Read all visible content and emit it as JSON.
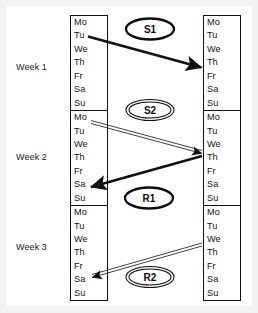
{
  "diagram": {
    "background_color": "#f2f2f2",
    "canvas_color": "#ffffff",
    "line_color": "#111111",
    "text_color": "#141414"
  },
  "weeks": [
    {
      "label": "Week 1",
      "days": [
        "Mo",
        "Tu",
        "We",
        "Th",
        "Fr",
        "Sa",
        "Su"
      ]
    },
    {
      "label": "Week 2",
      "days": [
        "Mo",
        "Tu",
        "We",
        "Th",
        "Fr",
        "Sa",
        "Su"
      ]
    },
    {
      "label": "Week 3",
      "days": [
        "Mo",
        "Tu",
        "We",
        "Th",
        "Fr",
        "Sa",
        "Su"
      ]
    }
  ],
  "columns": [
    {
      "name": "left-column"
    },
    {
      "name": "right-column"
    }
  ],
  "arrows": [
    {
      "id": "S1",
      "label": "S1",
      "style": "thick",
      "direction": "left-to-right",
      "from": {
        "column": "left",
        "week": "Week 1",
        "day": "Tu"
      },
      "to": {
        "column": "right",
        "week": "Week 1",
        "day": "Th"
      }
    },
    {
      "id": "S2",
      "label": "S2",
      "style": "thin-double",
      "direction": "left-to-right",
      "from": {
        "column": "left",
        "week": "Week 2",
        "day": "Mo"
      },
      "to": {
        "column": "right",
        "week": "Week 2",
        "day": "We"
      }
    },
    {
      "id": "R1",
      "label": "R1",
      "style": "thick",
      "direction": "right-to-left",
      "from": {
        "column": "right",
        "week": "Week 2",
        "day": "Th"
      },
      "to": {
        "column": "left",
        "week": "Week 2",
        "day": "Sa"
      }
    },
    {
      "id": "R2",
      "label": "R2",
      "style": "thin-double",
      "direction": "right-to-left",
      "from": {
        "column": "right",
        "week": "Week 3",
        "day": "We"
      },
      "to": {
        "column": "left",
        "week": "Week 3",
        "day": "Sa"
      }
    }
  ]
}
